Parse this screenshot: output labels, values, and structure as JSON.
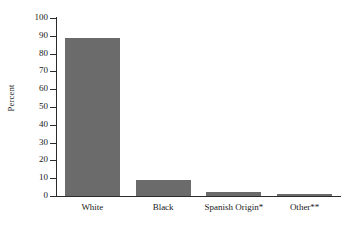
{
  "chart_data": {
    "type": "bar",
    "title": "",
    "subtitle": "",
    "xlabel": "",
    "ylabel": "Percent",
    "categories": [
      "White",
      "Black",
      "Spanish Origin*",
      "Other**"
    ],
    "values": [
      89,
      9,
      2,
      1
    ],
    "ylim": [
      0,
      100
    ],
    "ytick_labels": [
      "0",
      "10",
      "20",
      "30",
      "40",
      "50",
      "60",
      "70",
      "80",
      "90",
      "100"
    ],
    "ytick_values": [
      0,
      10,
      20,
      30,
      40,
      50,
      60,
      70,
      80,
      90,
      100
    ],
    "grid": false,
    "legend": false,
    "legend_position": "none",
    "series": [
      {
        "name": "Percent",
        "values": [
          89,
          9,
          2,
          1
        ]
      }
    ],
    "annotations": [],
    "colors": {
      "bar_fill": "#6b6b6b",
      "axis": "#2b2b2b",
      "text": "#1a1a1a",
      "background": "#ffffff"
    }
  }
}
